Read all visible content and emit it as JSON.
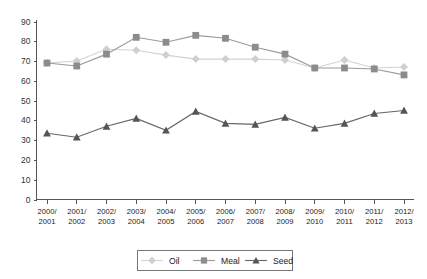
{
  "chart_data": {
    "type": "line",
    "title": "",
    "xlabel": "",
    "ylabel": "",
    "ylim": [
      0,
      90
    ],
    "yticks": [
      0,
      10,
      20,
      30,
      40,
      50,
      60,
      70,
      80,
      90
    ],
    "grid": false,
    "legend_position": "bottom",
    "categories": [
      "2000/\n2001",
      "2001/\n2002",
      "2002/\n2003",
      "2003/\n2004",
      "2004/\n2005",
      "2005/\n2006",
      "2006/\n2007",
      "2007/\n2008",
      "2008/\n2009",
      "2009/\n2010",
      "2010/\n2011",
      "2011/\n2012",
      "2012/\n2013"
    ],
    "categories_lines": [
      [
        "2000/",
        "2001"
      ],
      [
        "2001/",
        "2002"
      ],
      [
        "2002/",
        "2003"
      ],
      [
        "2003/",
        "2004"
      ],
      [
        "2004/",
        "2005"
      ],
      [
        "2005/",
        "2006"
      ],
      [
        "2006/",
        "2007"
      ],
      [
        "2007/",
        "2008"
      ],
      [
        "2008/",
        "2009"
      ],
      [
        "2009/",
        "2010"
      ],
      [
        "2010/",
        "2011"
      ],
      [
        "2011/",
        "2012"
      ],
      [
        "2012/",
        "2013"
      ]
    ],
    "series": [
      {
        "name": "Oil",
        "marker": "diamond",
        "color": "#cfcfcf",
        "line_color": "#d2d2d2",
        "values": [
          69,
          70,
          76,
          75.5,
          73,
          71,
          71,
          71,
          70.5,
          66.5,
          70.5,
          66.5,
          67
        ]
      },
      {
        "name": "Meal",
        "marker": "square",
        "color": "#8c8c8c",
        "line_color": "#9a9a9a",
        "values": [
          69,
          67.5,
          73.5,
          82,
          79.5,
          83,
          81.5,
          77,
          73.5,
          66.5,
          66.5,
          66,
          63
        ]
      },
      {
        "name": "Seed",
        "marker": "triangle",
        "color": "#555555",
        "line_color": "#666666",
        "values": [
          33.5,
          31.5,
          37,
          41,
          35,
          44.5,
          38.5,
          38,
          41.5,
          36,
          38.5,
          43.5,
          45
        ]
      }
    ]
  },
  "legend": {
    "items": [
      {
        "label": "Oil"
      },
      {
        "label": "Meal"
      },
      {
        "label": "Seed"
      }
    ]
  }
}
